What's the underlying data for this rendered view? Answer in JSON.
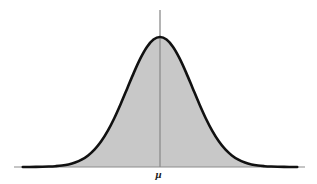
{
  "figure": {
    "title": "",
    "background_color": "#ffffff",
    "axis_color": "#808080",
    "curve_color": "#111111",
    "fill_color": "#c8c8c8",
    "mean_label": "μ",
    "mean_label_color": "#1a1a1a"
  },
  "axes": {
    "horizontal": {
      "x_start": 14,
      "x_end": 305,
      "y": 167,
      "thickness": 1
    },
    "vertical": {
      "x": 160,
      "y_top": 10,
      "y_bottom": 167,
      "thickness": 1.4
    }
  },
  "chart_data": {
    "type": "line",
    "title": "",
    "subtitle": "",
    "xlabel": "",
    "ylabel": "",
    "grid": false,
    "legend": "none",
    "annotations": [
      {
        "text": "μ",
        "x": 0,
        "y": 0,
        "position": "below-axis-center",
        "style": "bold-italic"
      }
    ],
    "distribution": "normal",
    "mean": 0,
    "sd": 1,
    "xlim": [
      -4.2,
      4.2
    ],
    "ylim": [
      0,
      1.06
    ],
    "curve_peak_px": {
      "x": 160,
      "y": 37
    },
    "baseline_y_px": 167,
    "tail_flatten_px": {
      "left": 62,
      "right": 258
    },
    "x": [
      -4.2,
      -4.0,
      -3.8,
      -3.6,
      -3.4,
      -3.2,
      -3.0,
      -2.8,
      -2.6,
      -2.4,
      -2.2,
      -2.0,
      -1.8,
      -1.6,
      -1.4,
      -1.2,
      -1.0,
      -0.8,
      -0.6,
      -0.4,
      -0.2,
      0.0,
      0.2,
      0.4,
      0.6,
      0.8,
      1.0,
      1.2,
      1.4,
      1.6,
      1.8,
      2.0,
      2.2,
      2.4,
      2.6,
      2.8,
      3.0,
      3.2,
      3.4,
      3.6,
      3.8,
      4.0,
      4.2
    ],
    "y": [
      0.0001,
      0.0003,
      0.0007,
      0.0016,
      0.0034,
      0.0063,
      0.0111,
      0.0198,
      0.034,
      0.0561,
      0.0889,
      0.1353,
      0.1979,
      0.278,
      0.3753,
      0.4868,
      0.6065,
      0.7261,
      0.8353,
      0.9231,
      0.9802,
      1.0,
      0.9802,
      0.9231,
      0.8353,
      0.7261,
      0.6065,
      0.4868,
      0.3753,
      0.278,
      0.1979,
      0.1353,
      0.0889,
      0.0561,
      0.034,
      0.0198,
      0.0111,
      0.0063,
      0.0034,
      0.0016,
      0.0007,
      0.0003,
      0.0001
    ],
    "series": [
      {
        "name": "normal-density",
        "values": [
          0.0001,
          0.0003,
          0.0007,
          0.0016,
          0.0034,
          0.0063,
          0.0111,
          0.0198,
          0.034,
          0.0561,
          0.0889,
          0.1353,
          0.1979,
          0.278,
          0.3753,
          0.4868,
          0.6065,
          0.7261,
          0.8353,
          0.9231,
          0.9802,
          1.0,
          0.9802,
          0.9231,
          0.8353,
          0.7261,
          0.6065,
          0.4868,
          0.3753,
          0.278,
          0.1979,
          0.1353,
          0.0889,
          0.0561,
          0.034,
          0.0198,
          0.0111,
          0.0063,
          0.0034,
          0.0016,
          0.0007,
          0.0003,
          0.0001
        ],
        "fill": true,
        "fill_color": "#c8c8c8",
        "stroke_color": "#111111",
        "stroke_width": 2.6
      }
    ]
  }
}
